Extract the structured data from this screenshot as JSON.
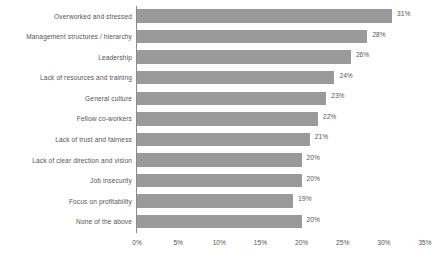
{
  "chart_data": {
    "type": "bar",
    "orientation": "horizontal",
    "title": "",
    "xlabel": "",
    "ylabel": "",
    "xlim": [
      0,
      35
    ],
    "xticks": [
      "0%",
      "5%",
      "10%",
      "15%",
      "20%",
      "25%",
      "30%",
      "35%"
    ],
    "xtick_values": [
      0,
      5,
      10,
      15,
      20,
      25,
      30,
      35
    ],
    "grid": false,
    "legend": false,
    "bar_color": "#9a9a9a",
    "text_color": "#555555",
    "axis_color": "#8a8a8a",
    "categories": [
      "Overworked and stressed",
      "Management structures / hierarchy",
      "Leadership",
      "Lack of resources and training",
      "General culture",
      "Fellow co-workers",
      "Lack of trust and fairness",
      "Lack of clear direction and vision",
      "Job insecurity",
      "Focus on profitability",
      "None of the above"
    ],
    "values": [
      31,
      28,
      26,
      24,
      23,
      22,
      21,
      20,
      20,
      19,
      20
    ],
    "value_labels": [
      "31%",
      "28%",
      "26%",
      "24%",
      "23%",
      "22%",
      "21%",
      "20%",
      "20%",
      "19%",
      "20%"
    ]
  }
}
